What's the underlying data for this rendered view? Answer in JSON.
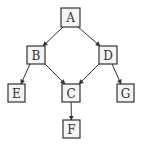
{
  "diagram": {
    "type": "directed-tree-dag",
    "colors": {
      "stroke": "#333333",
      "fill": "#f4f4f4",
      "background": "#ffffff"
    },
    "nodes": [
      {
        "id": "A",
        "label": "A",
        "x": 61,
        "y": 8,
        "w": 19,
        "h": 19
      },
      {
        "id": "B",
        "label": "B",
        "x": 27,
        "y": 46,
        "w": 18,
        "h": 18
      },
      {
        "id": "D",
        "label": "D",
        "x": 99,
        "y": 46,
        "w": 18,
        "h": 18
      },
      {
        "id": "E",
        "label": "E",
        "x": 8,
        "y": 84,
        "w": 17,
        "h": 18
      },
      {
        "id": "C",
        "label": "C",
        "x": 62,
        "y": 84,
        "w": 18,
        "h": 18
      },
      {
        "id": "G",
        "label": "G",
        "x": 117,
        "y": 84,
        "w": 17,
        "h": 18
      },
      {
        "id": "F",
        "label": "F",
        "x": 63,
        "y": 120,
        "w": 17,
        "h": 18
      }
    ],
    "edges": [
      {
        "from": "A",
        "to": "B"
      },
      {
        "from": "A",
        "to": "D"
      },
      {
        "from": "B",
        "to": "E"
      },
      {
        "from": "B",
        "to": "C"
      },
      {
        "from": "D",
        "to": "C"
      },
      {
        "from": "D",
        "to": "G"
      },
      {
        "from": "C",
        "to": "F"
      }
    ]
  }
}
